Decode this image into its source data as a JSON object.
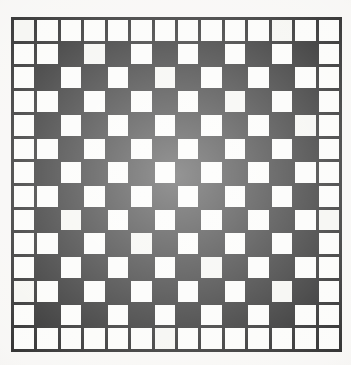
{
  "figure": {
    "kind": "checkerboard-grid",
    "background_color": "#f7f6f4",
    "ink_color": "#141414",
    "cell_fill_white": "#fbfbf9",
    "cell_fill_black": "#141414",
    "line_width_px": 3
  },
  "grid": {
    "rows": 14,
    "columns": 14,
    "total_cells": 196,
    "plate_left_px": 11,
    "plate_top_px": 17,
    "plate_width_px": 331,
    "plate_height_px": 335,
    "border_ring_fill": "white",
    "interior_rows": 12,
    "interior_columns": 12,
    "interior_pattern": "checkerboard",
    "black_cell_count": 72,
    "white_cell_count": 124
  },
  "chart_data": {
    "type": "heatmap",
    "xlabel": "",
    "ylabel": "",
    "legend": [],
    "categories_x": [
      "1",
      "2",
      "3",
      "4",
      "5",
      "6",
      "7",
      "8",
      "9",
      "10",
      "11",
      "12",
      "13",
      "14"
    ],
    "categories_y": [
      "1",
      "2",
      "3",
      "4",
      "5",
      "6",
      "7",
      "8",
      "9",
      "10",
      "11",
      "12",
      "13",
      "14"
    ],
    "value_map": {
      "0": "white",
      "1": "black"
    },
    "matrix": [
      [
        0,
        0,
        0,
        0,
        0,
        0,
        0,
        0,
        0,
        0,
        0,
        0,
        0,
        0
      ],
      [
        0,
        0,
        1,
        0,
        1,
        0,
        1,
        0,
        1,
        0,
        1,
        0,
        1,
        0
      ],
      [
        0,
        1,
        0,
        1,
        0,
        1,
        0,
        1,
        0,
        1,
        0,
        1,
        0,
        0
      ],
      [
        0,
        0,
        1,
        0,
        1,
        0,
        1,
        0,
        1,
        0,
        1,
        0,
        1,
        0
      ],
      [
        0,
        1,
        0,
        1,
        0,
        1,
        0,
        1,
        0,
        1,
        0,
        1,
        0,
        0
      ],
      [
        0,
        0,
        1,
        0,
        1,
        0,
        1,
        0,
        1,
        0,
        1,
        0,
        1,
        0
      ],
      [
        0,
        1,
        0,
        1,
        0,
        1,
        0,
        1,
        0,
        1,
        0,
        1,
        0,
        0
      ],
      [
        0,
        0,
        1,
        0,
        1,
        0,
        1,
        0,
        1,
        0,
        1,
        0,
        1,
        0
      ],
      [
        0,
        1,
        0,
        1,
        0,
        1,
        0,
        1,
        0,
        1,
        0,
        1,
        0,
        0
      ],
      [
        0,
        0,
        1,
        0,
        1,
        0,
        1,
        0,
        1,
        0,
        1,
        0,
        1,
        0
      ],
      [
        0,
        1,
        0,
        1,
        0,
        1,
        0,
        1,
        0,
        1,
        0,
        1,
        0,
        0
      ],
      [
        0,
        0,
        1,
        0,
        1,
        0,
        1,
        0,
        1,
        0,
        1,
        0,
        1,
        0
      ],
      [
        0,
        1,
        0,
        1,
        0,
        1,
        0,
        1,
        0,
        1,
        0,
        1,
        0,
        0
      ],
      [
        0,
        0,
        0,
        0,
        0,
        0,
        0,
        0,
        0,
        0,
        0,
        0,
        0,
        0
      ]
    ]
  }
}
